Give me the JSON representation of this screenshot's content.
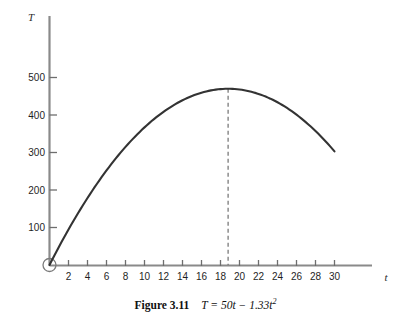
{
  "figure": {
    "caption_label": "Figure 3.11",
    "caption_equation_html": "T = 50t − 1.33t",
    "caption_exponent": "2"
  },
  "chart_data": {
    "type": "line",
    "title": "",
    "subtitle": "",
    "xlabel": "t",
    "ylabel": "T",
    "equation": "T = 50t - 1.33t^2",
    "xlim": [
      0,
      34
    ],
    "ylim": [
      0,
      560
    ],
    "grid": false,
    "legend": null,
    "x_ticks": [
      2,
      4,
      6,
      8,
      10,
      12,
      14,
      16,
      18,
      20,
      22,
      24,
      26,
      28,
      30
    ],
    "x_tick_labels": [
      "2",
      "4",
      "6",
      "8",
      "10",
      "12",
      "14",
      "16",
      "18",
      "20",
      "22",
      "24",
      "26",
      "28",
      "30"
    ],
    "y_ticks": [
      100,
      200,
      300,
      400,
      500
    ],
    "y_tick_labels": [
      "100",
      "200",
      "300",
      "400",
      "500"
    ],
    "series": [
      {
        "name": "T = 50t - 1.33t^2",
        "color": "#333333",
        "x": [
          0,
          1,
          2,
          3,
          4,
          5,
          6,
          7,
          8,
          9,
          10,
          11,
          12,
          13,
          14,
          15,
          16,
          17,
          18,
          19,
          20,
          21,
          22,
          23,
          24,
          25,
          26,
          27,
          28,
          29,
          30
        ],
        "values": [
          0,
          48.7,
          94.7,
          138.0,
          178.7,
          216.8,
          252.1,
          284.8,
          314.9,
          342.3,
          367.0,
          389.1,
          408.5,
          427.3,
          439.3,
          450.8,
          459.5,
          465.6,
          469.1,
          469.9,
          468.0,
          463.5,
          456.3,
          430.5,
          433.9,
          418.8,
          401.0,
          380.5,
          337.4,
          331.0,
          303.0
        ]
      }
    ],
    "annotations": [
      {
        "type": "vertical-dashed-line",
        "x": 18.8,
        "y_top": 470,
        "y_bottom": 0,
        "label": ""
      },
      {
        "type": "origin-circle",
        "x": 0,
        "y": 0,
        "label": ""
      }
    ],
    "vertex": {
      "t": 18.8,
      "T": 470
    }
  }
}
